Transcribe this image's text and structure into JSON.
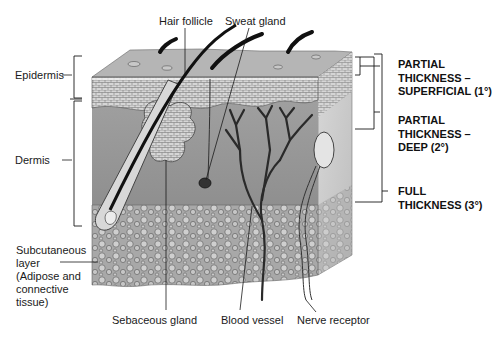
{
  "diagram": {
    "anatomy_labels": {
      "hair_follicle": "Hair follicle",
      "sweat_gland": "Sweat gland",
      "epidermis": "Epidermis",
      "dermis": "Dermis",
      "subcutaneous_1": "Subcutaneous",
      "subcutaneous_2": "layer",
      "subcutaneous_3": "(Adipose and",
      "subcutaneous_4": "connective",
      "subcutaneous_5": "tissue)",
      "sebaceous_gland": "Sebaceous gland",
      "blood_vessel": "Blood vessel",
      "nerve_receptor": "Nerve receptor"
    },
    "burn_depths": [
      {
        "lines": [
          "PARTIAL",
          "THICKNESS –",
          "SUPERFICIAL (1°)"
        ]
      },
      {
        "lines": [
          "PARTIAL",
          "THICKNESS –",
          "DEEP (2°)"
        ]
      },
      {
        "lines": [
          "FULL",
          "THICKNESS (3°)"
        ]
      }
    ],
    "colors": {
      "surface": "#b8b8b8",
      "epidermis": "#d2d2d2",
      "dermis": "#9a9a9a",
      "subcutaneous": "#a5a5a5",
      "side_face": "#c8c8c8",
      "line": "#1a1a1a"
    }
  }
}
